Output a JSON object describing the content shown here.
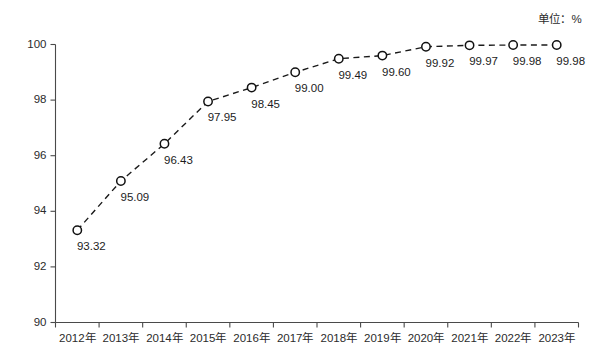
{
  "unit_note": "单位：%",
  "chart_data": {
    "type": "line",
    "title": "",
    "subtitle": "",
    "xlabel": "",
    "ylabel": "",
    "unit": "%",
    "categories": [
      "2012年",
      "2013年",
      "2014年",
      "2015年",
      "2016年",
      "2017年",
      "2018年",
      "2019年",
      "2020年",
      "2021年",
      "2022年",
      "2023年"
    ],
    "values": [
      93.32,
      95.09,
      96.43,
      97.95,
      98.45,
      99.0,
      99.49,
      99.6,
      99.92,
      99.97,
      99.98,
      99.98
    ],
    "point_labels": [
      "93.32",
      "95.09",
      "96.43",
      "97.95",
      "98.45",
      "99.00",
      "99.49",
      "99.60",
      "99.92",
      "99.97",
      "99.98",
      "99.98"
    ],
    "ylim": [
      90,
      100
    ],
    "yticks": [
      90,
      92,
      94,
      96,
      98,
      100
    ],
    "ytick_labels": [
      "90",
      "92",
      "94",
      "96",
      "98",
      "100"
    ],
    "grid": false,
    "legend": null,
    "legend_position": "none",
    "marker": "open-circle",
    "line_style": "dashed",
    "series_color": "#1a1a1a"
  }
}
